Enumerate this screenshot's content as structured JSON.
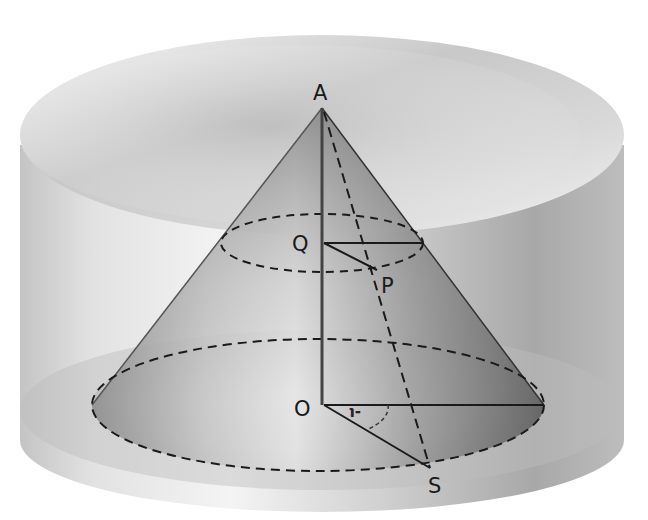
{
  "diagram": {
    "labels": {
      "apex": "A",
      "section_center": "Q",
      "section_point": "P",
      "base_center": "O",
      "base_point": "S",
      "angle": "-ι"
    },
    "colors": {
      "background": "#ffffff",
      "cylinder_light": "#f2f2f2",
      "cylinder_dark": "#9a9a9a",
      "cone_dark": "#7a7a7a",
      "lines": "#1a1a1a"
    }
  }
}
